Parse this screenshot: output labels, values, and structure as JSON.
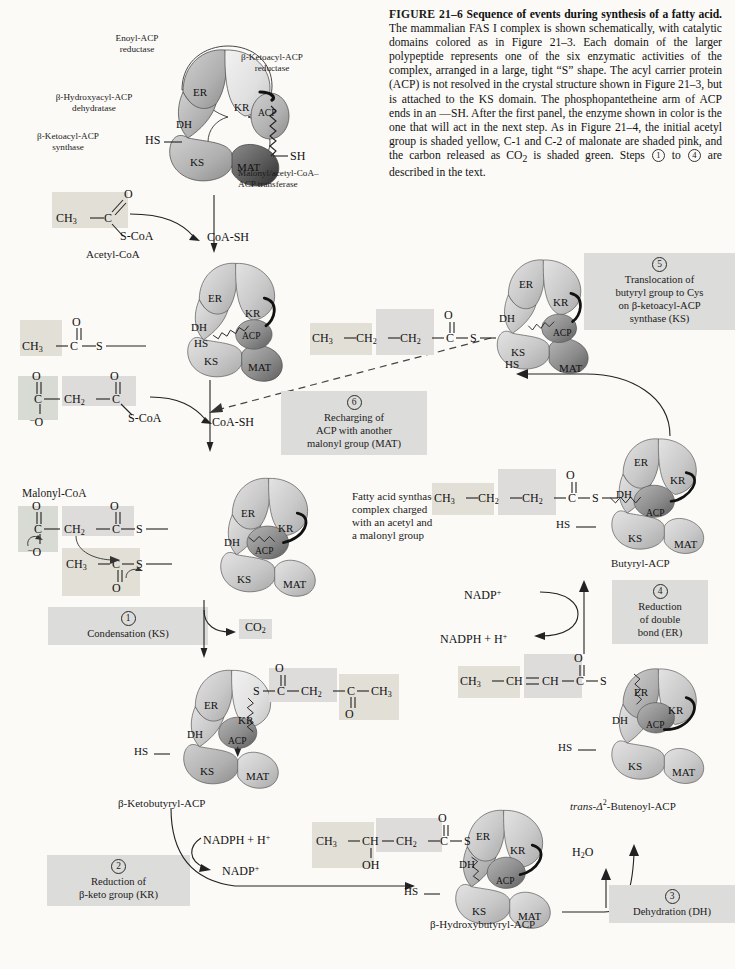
{
  "figure": {
    "number": "FIGURE 21–6",
    "title": "Sequence of events during synthesis of a fatty acid.",
    "body_1": "The mammalian FAS I complex is shown schematically, with catalytic domains colored as in Figure 21–3. Each domain of the larger polypeptide represents one of the six enzymatic activities of the complex, arranged in a large, tight “S” shape. The acyl carrier protein (ACP) is not resolved in the crystal structure shown in Figure 21–3, but is attached to the KS domain. The phosphopantetheine arm of ACP ends in an —SH. After the first panel, the enzyme shown in color is the one that will act in the next step. As in Figure 21–4, the initial acetyl group is shaded yellow, C-1 and C-2 of malonate are shaded pink, and the carbon released as CO",
    "body_2": " is shaded green. Steps ",
    "body_3": " to ",
    "body_4": " are described in the text.",
    "sub_2": "2",
    "step_a": "1",
    "step_b": "4"
  },
  "enzyme_labels": {
    "enoyl_acp_reductase": "Enoyl-ACP\nreductase",
    "ketoacyl_reductase": "β-Ketoacyl-ACP\nreductase",
    "hydroxyacyl_dehydratase": "β-Hydroxyacyl-ACP\ndehydratase",
    "ketoacyl_synthase": "β-Ketoacyl-ACP\nsynthase",
    "malonyl_transferase": "Malonyl/acetyl-CoA–\nACP transferase"
  },
  "domains": {
    "er": "ER",
    "kr": "KR",
    "dh": "DH",
    "ks": "KS",
    "mat": "MAT",
    "acp": "ACP",
    "hs": "HS",
    "sh": "SH",
    "s": "S"
  },
  "panels": {
    "p1_label": "",
    "p5_label": "",
    "butyryl": "Butyryl-ACP",
    "ketobutyryl": "β-Ketobutyryl-ACP",
    "hydroxybutyryl": "β-Hydroxybutyryl-ACP",
    "butenoyl_prefix": "trans-Δ",
    "butenoyl_sup": "2",
    "butenoyl_suffix": "-Butenoyl-ACP"
  },
  "molecules": {
    "acetyl_coa_name": "Acetyl-CoA",
    "malonyl_coa_name": "Malonyl-CoA",
    "coash": "CoA-SH",
    "scoa": "S-CoA",
    "co2": "CO2",
    "co2_sub": "2",
    "h2o": "H2O",
    "h2o_sub": "2",
    "ch3": "CH3",
    "ch2": "CH2",
    "ch": "CH",
    "c": "C",
    "o": "O",
    "oh": "OH",
    "s": "S",
    "nadph": "NADPH + H+",
    "nadp": "NADP+"
  },
  "steps": {
    "s1": {
      "num": "1",
      "text": "Condensation (KS)"
    },
    "s2": {
      "num": "2",
      "line1": "Reduction of",
      "line2": "β-keto group (KR)"
    },
    "s3": {
      "num": "3",
      "text": "Dehydration (DH)"
    },
    "s4": {
      "num": "4",
      "line1": "Reduction",
      "line2": "of double",
      "line3": "bond (ER)"
    },
    "s5": {
      "num": "5",
      "line1": "Translocation of",
      "line2": "butyryl group to Cys",
      "line3": "on β-ketoacyl-ACP",
      "line4": "synthase (KS)"
    },
    "s6": {
      "num": "6",
      "line1": "Recharging of",
      "line2": "ACP with another",
      "line3": "malonyl group (MAT)"
    }
  },
  "annotations": {
    "charged_complex": "Fatty acid synthase\ncomplex charged\nwith an acetyl and\na malonyl group"
  },
  "colors": {
    "page_bg": "#fbfaf7",
    "shade_box": "#dcdcda",
    "domain_light": "#cfcfcf",
    "domain_mid": "#b4b4b4",
    "domain_dark": "#8f8f8f",
    "ink": "#1a1a1a"
  }
}
